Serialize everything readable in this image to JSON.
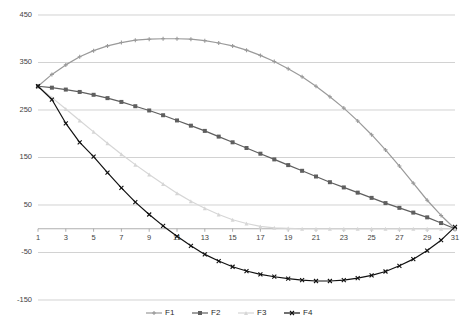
{
  "chart_data": {
    "type": "line",
    "title": "",
    "xlabel": "",
    "ylabel": "",
    "xlim": [
      1,
      31
    ],
    "ylim": [
      -150,
      450
    ],
    "grid": true,
    "legend_position": "bottom",
    "y_ticks": [
      450,
      350,
      250,
      150,
      50,
      -50,
      -150
    ],
    "x_ticks": [
      1,
      3,
      5,
      7,
      9,
      11,
      13,
      15,
      17,
      19,
      21,
      23,
      25,
      27,
      29,
      31
    ],
    "x": [
      1,
      2,
      3,
      4,
      5,
      6,
      7,
      8,
      9,
      10,
      11,
      12,
      13,
      14,
      15,
      16,
      17,
      18,
      19,
      20,
      21,
      22,
      23,
      24,
      25,
      26,
      27,
      28,
      29,
      30,
      31
    ],
    "series": [
      {
        "name": "F1",
        "color": "#9a9a9a",
        "marker": "plus",
        "values": [
          300,
          325,
          345,
          362,
          375,
          385,
          392,
          397,
          399,
          400,
          400,
          399,
          396,
          391,
          385,
          376,
          365,
          352,
          337,
          320,
          300,
          278,
          254,
          227,
          198,
          166,
          132,
          96,
          60,
          28,
          0
        ]
      },
      {
        "name": "F2",
        "color": "#5f5f5f",
        "marker": "square",
        "values": [
          300,
          297,
          293,
          288,
          282,
          275,
          267,
          258,
          249,
          239,
          228,
          217,
          206,
          194,
          182,
          170,
          158,
          146,
          134,
          122,
          110,
          98,
          87,
          76,
          65,
          54,
          44,
          34,
          24,
          12,
          0
        ]
      },
      {
        "name": "F3",
        "color": "#d6d6d6",
        "marker": "triangle",
        "values": [
          300,
          276,
          252,
          228,
          204,
          180,
          157,
          135,
          114,
          94,
          75,
          58,
          43,
          30,
          19,
          11,
          5,
          2,
          1,
          0,
          0,
          0,
          0,
          0,
          0,
          0,
          0,
          0,
          0,
          0,
          0
        ]
      },
      {
        "name": "F4",
        "color": "#111111",
        "marker": "x",
        "values": [
          300,
          272,
          222,
          182,
          152,
          118,
          86,
          56,
          30,
          6,
          -16,
          -36,
          -54,
          -68,
          -80,
          -89,
          -96,
          -101,
          -105,
          -108,
          -110,
          -110,
          -108,
          -104,
          -98,
          -90,
          -78,
          -64,
          -46,
          -24,
          4
        ]
      }
    ],
    "legend": [
      {
        "label": "F1",
        "color": "#9a9a9a",
        "marker": "plus"
      },
      {
        "label": "F2",
        "color": "#5f5f5f",
        "marker": "square"
      },
      {
        "label": "F3",
        "color": "#d6d6d6",
        "marker": "triangle"
      },
      {
        "label": "F4",
        "color": "#111111",
        "marker": "x"
      }
    ]
  }
}
